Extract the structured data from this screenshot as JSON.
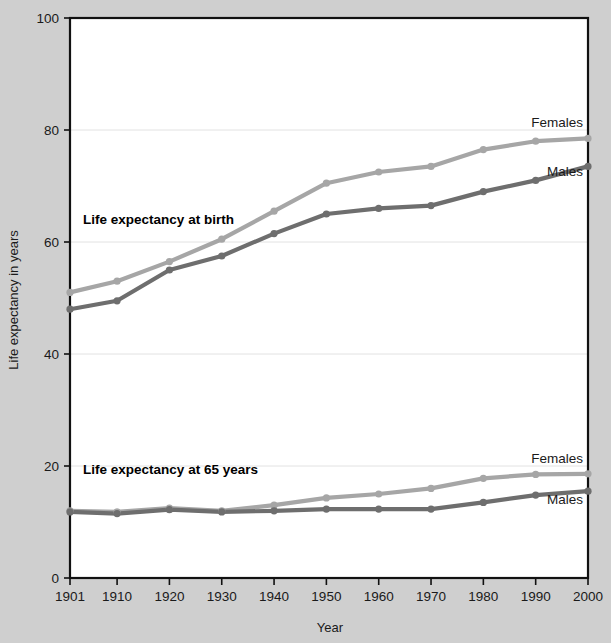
{
  "chart_data": {
    "type": "line",
    "title": "",
    "xlabel": "Year",
    "ylabel": "Life expectancy in years",
    "x": [
      1901,
      1910,
      1920,
      1930,
      1940,
      1950,
      1960,
      1970,
      1980,
      1990,
      2000
    ],
    "xtick_labels": [
      "1901",
      "1910",
      "1920",
      "1930",
      "1940",
      "1950",
      "1960",
      "1970",
      "1980",
      "1990",
      "2000"
    ],
    "ytick_labels": [
      "0",
      "20",
      "40",
      "60",
      "80",
      "100"
    ],
    "yticks": [
      0,
      20,
      40,
      60,
      80,
      100
    ],
    "ylim": [
      0,
      100
    ],
    "xlim": [
      1901,
      2000
    ],
    "grid": "horizontal-faint",
    "legend_position": "inline-right-end-labels",
    "series": [
      {
        "name": "Females",
        "group": "Life expectancy at birth",
        "color": "#a6a6a6",
        "end_label": "Females",
        "values": [
          51.0,
          53.0,
          56.5,
          60.5,
          65.5,
          70.5,
          72.5,
          73.5,
          76.5,
          78.0,
          78.5
        ]
      },
      {
        "name": "Males",
        "group": "Life expectancy at birth",
        "color": "#6e6e6e",
        "end_label": "Males",
        "values": [
          48.0,
          49.5,
          55.0,
          57.5,
          61.5,
          65.0,
          66.0,
          66.5,
          69.0,
          71.0,
          73.5
        ]
      },
      {
        "name": "Females",
        "group": "Life expectancy at 65 years",
        "color": "#a6a6a6",
        "end_label": "Females",
        "values": [
          12.0,
          11.8,
          12.5,
          12.0,
          13.0,
          14.3,
          15.0,
          16.0,
          17.8,
          18.5,
          18.6
        ]
      },
      {
        "name": "Males",
        "group": "Life expectancy at 65 years",
        "color": "#6e6e6e",
        "end_label": "Males",
        "values": [
          11.8,
          11.5,
          12.2,
          11.8,
          12.0,
          12.3,
          12.3,
          12.3,
          13.5,
          14.8,
          15.5
        ]
      }
    ],
    "annotations": [
      {
        "text": "Life expectancy at birth",
        "x_value": 1903.5,
        "y_value": 63.2
      },
      {
        "text": "Life expectancy at 65 years",
        "x_value": 1903.5,
        "y_value": 18.6
      }
    ],
    "end_labels": [
      {
        "text": "Females",
        "y_value": 80.5
      },
      {
        "text": "Males",
        "y_value": 71.8
      },
      {
        "text": "Females",
        "y_value": 20.6
      },
      {
        "text": "Males",
        "y_value": 13.2
      }
    ]
  },
  "colors": {
    "page_background": "#cfcfcf",
    "plot_background": "#ffffff",
    "axis": "#111111",
    "gridline": "#e2e2e2",
    "females_series": "#a6a6a6",
    "males_series": "#6e6e6e",
    "text": "#1a1a1a"
  }
}
